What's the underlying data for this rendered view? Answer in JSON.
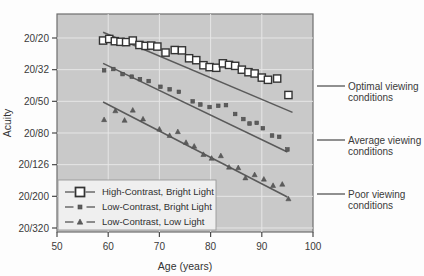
{
  "chart_data": {
    "type": "scatter",
    "title": "",
    "xlabel": "Age (years)",
    "ylabel": "Acuity",
    "xlim": [
      50,
      100
    ],
    "ylim_index": [
      0,
      6
    ],
    "xticks": [
      50,
      60,
      70,
      80,
      90,
      100
    ],
    "yticks": [
      "20/20",
      "20/32",
      "20/50",
      "20/80",
      "20/126",
      "20/200",
      "20/320"
    ],
    "grid": true,
    "legend_position": "bottom-left",
    "plot_background": "#c9c9c9",
    "canvas_background": "#fdfdfd",
    "marker_color": "#4a4a4a",
    "line_color": "#5a5a5a",
    "series": [
      {
        "name": "High-Contrast, Bright Light",
        "marker": "open-square",
        "trend": {
          "x1": 59,
          "y1": -0.18,
          "x2": 96,
          "y2": 2.35
        },
        "points": [
          {
            "x": 59.0,
            "y": 0.08
          },
          {
            "x": 60.2,
            "y": 0.03
          },
          {
            "x": 61.3,
            "y": 0.1
          },
          {
            "x": 62.4,
            "y": 0.12
          },
          {
            "x": 63.5,
            "y": 0.13
          },
          {
            "x": 64.8,
            "y": 0.08
          },
          {
            "x": 66.1,
            "y": 0.22
          },
          {
            "x": 67.3,
            "y": 0.25
          },
          {
            "x": 68.4,
            "y": 0.24
          },
          {
            "x": 69.6,
            "y": 0.27
          },
          {
            "x": 71.2,
            "y": 0.46
          },
          {
            "x": 73.0,
            "y": 0.38
          },
          {
            "x": 74.4,
            "y": 0.39
          },
          {
            "x": 75.8,
            "y": 0.64
          },
          {
            "x": 77.2,
            "y": 0.7
          },
          {
            "x": 78.6,
            "y": 0.86
          },
          {
            "x": 79.8,
            "y": 0.92
          },
          {
            "x": 81.1,
            "y": 0.94
          },
          {
            "x": 82.4,
            "y": 0.8
          },
          {
            "x": 83.6,
            "y": 0.85
          },
          {
            "x": 84.8,
            "y": 0.88
          },
          {
            "x": 86.1,
            "y": 1.0
          },
          {
            "x": 87.4,
            "y": 1.08
          },
          {
            "x": 88.6,
            "y": 1.12
          },
          {
            "x": 90.0,
            "y": 1.25
          },
          {
            "x": 91.2,
            "y": 1.32
          },
          {
            "x": 93.0,
            "y": 1.28
          },
          {
            "x": 95.2,
            "y": 1.8
          }
        ]
      },
      {
        "name": "Low-Contrast, Bright Light",
        "marker": "filled-square",
        "trend": {
          "x1": 59,
          "y1": 0.8,
          "x2": 95,
          "y2": 3.6
        },
        "points": [
          {
            "x": 59.2,
            "y": 1.02
          },
          {
            "x": 61.0,
            "y": 0.98
          },
          {
            "x": 62.8,
            "y": 1.14
          },
          {
            "x": 64.6,
            "y": 1.22
          },
          {
            "x": 66.2,
            "y": 1.3
          },
          {
            "x": 67.9,
            "y": 1.36
          },
          {
            "x": 70.2,
            "y": 1.54
          },
          {
            "x": 72.0,
            "y": 1.62
          },
          {
            "x": 73.8,
            "y": 1.7
          },
          {
            "x": 76.5,
            "y": 2.0
          },
          {
            "x": 78.0,
            "y": 2.1
          },
          {
            "x": 79.8,
            "y": 2.18
          },
          {
            "x": 81.5,
            "y": 2.14
          },
          {
            "x": 83.0,
            "y": 2.12
          },
          {
            "x": 84.8,
            "y": 2.4
          },
          {
            "x": 86.4,
            "y": 2.56
          },
          {
            "x": 87.6,
            "y": 2.7
          },
          {
            "x": 89.0,
            "y": 2.68
          },
          {
            "x": 90.2,
            "y": 2.85
          },
          {
            "x": 92.0,
            "y": 3.08
          },
          {
            "x": 93.4,
            "y": 3.12
          },
          {
            "x": 95.0,
            "y": 3.52
          }
        ]
      },
      {
        "name": "Low-Contrast, Low Light",
        "marker": "triangle",
        "trend": {
          "x1": 59,
          "y1": 2.02,
          "x2": 95,
          "y2": 5.02
        },
        "points": [
          {
            "x": 59.2,
            "y": 2.58
          },
          {
            "x": 61.4,
            "y": 2.3
          },
          {
            "x": 63.2,
            "y": 2.6
          },
          {
            "x": 64.8,
            "y": 2.28
          },
          {
            "x": 66.8,
            "y": 2.56
          },
          {
            "x": 70.0,
            "y": 2.88
          },
          {
            "x": 72.0,
            "y": 3.08
          },
          {
            "x": 73.6,
            "y": 2.96
          },
          {
            "x": 75.2,
            "y": 3.3
          },
          {
            "x": 76.8,
            "y": 3.42
          },
          {
            "x": 78.6,
            "y": 3.68
          },
          {
            "x": 80.2,
            "y": 3.8
          },
          {
            "x": 82.0,
            "y": 3.72
          },
          {
            "x": 83.6,
            "y": 4.08
          },
          {
            "x": 85.4,
            "y": 4.1
          },
          {
            "x": 86.8,
            "y": 4.42
          },
          {
            "x": 88.6,
            "y": 4.32
          },
          {
            "x": 90.4,
            "y": 4.46
          },
          {
            "x": 92.2,
            "y": 4.66
          },
          {
            "x": 94.0,
            "y": 4.62
          },
          {
            "x": 95.2,
            "y": 5.08
          }
        ]
      }
    ]
  },
  "legend": {
    "items": [
      {
        "label": "High-Contrast, Bright Light",
        "marker": "open-square"
      },
      {
        "label": "Low-Contrast, Bright Light",
        "marker": "filled-square"
      },
      {
        "label": "Low-Contrast, Low Light",
        "marker": "triangle"
      }
    ]
  },
  "annotations": [
    {
      "line1": "Optimal viewing",
      "line2": "conditions",
      "y": 86
    },
    {
      "line1": "Average viewing",
      "line2": "conditions",
      "y": 140
    },
    {
      "line1": "Poor viewing",
      "line2": "conditions",
      "y": 194
    }
  ]
}
